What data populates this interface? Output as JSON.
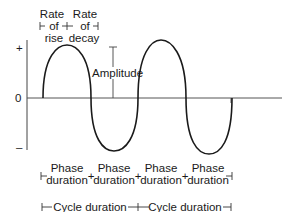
{
  "diagram": {
    "axis_labels": {
      "positive": "+",
      "zero": "0",
      "negative": "–"
    },
    "top_annotations": {
      "rate_of_rise": [
        "Rate",
        "of",
        "rise"
      ],
      "rate_of_decay": [
        "Rate",
        "of",
        "decay"
      ]
    },
    "amplitude_label": "Amplitude",
    "phase_labels": [
      [
        "Phase",
        "duration"
      ],
      [
        "Phase",
        "duration"
      ],
      [
        "Phase",
        "duration"
      ],
      [
        "Phase",
        "duration"
      ]
    ],
    "cycle_labels": [
      "Cycle duration",
      "Cycle duration"
    ],
    "colors": {
      "line": "#1a1a1a",
      "axis": "#555555",
      "background": "#ffffff"
    }
  }
}
